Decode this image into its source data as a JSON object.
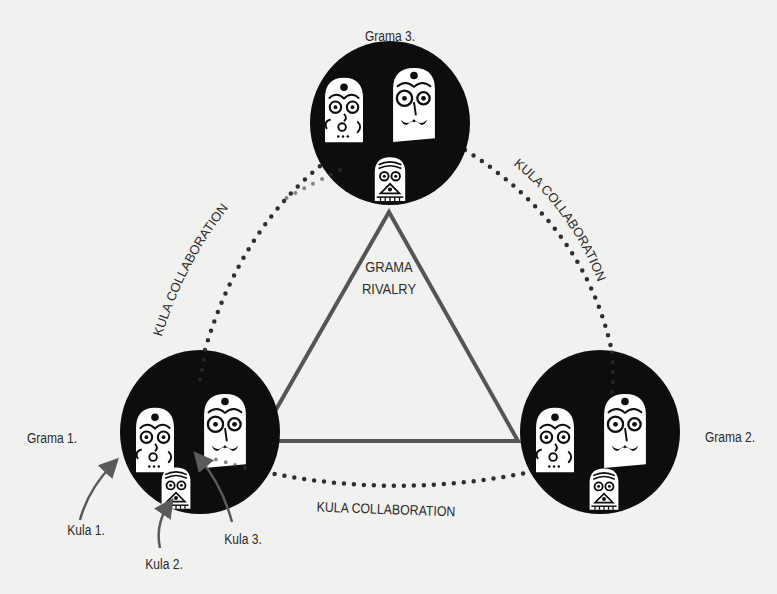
{
  "diagram": {
    "type": "relationship-diagram",
    "colors": {
      "background": "#f1f1ef",
      "circle_fill": "#0d0d0d",
      "triangle_stroke": "#555555",
      "dots": "#2e2e2e",
      "text": "#2b2b2b",
      "arrow": "#5a5a5a"
    },
    "center": {
      "line1": "GRAMA",
      "line2": "RIVALRY"
    },
    "gramas": [
      {
        "id": "grama-1",
        "label": "Grama 1."
      },
      {
        "id": "grama-2",
        "label": "Grama 2."
      },
      {
        "id": "grama-3",
        "label": "Grama 3."
      }
    ],
    "kulas": [
      {
        "id": "kula-1",
        "label": "Kula 1.",
        "icon": "goddess-mask-icon"
      },
      {
        "id": "kula-2",
        "label": "Kula 2.",
        "icon": "small-mask-icon"
      },
      {
        "id": "kula-3",
        "label": "Kula 3.",
        "icon": "mustached-mask-icon"
      }
    ],
    "links": [
      {
        "label": "KULA COLLABORATION",
        "from": "grama-1",
        "to": "grama-3"
      },
      {
        "label": "KULA COLLABORATION",
        "from": "grama-3",
        "to": "grama-2"
      },
      {
        "label": "KULA COLLABORATION",
        "from": "grama-1",
        "to": "grama-2"
      }
    ]
  }
}
